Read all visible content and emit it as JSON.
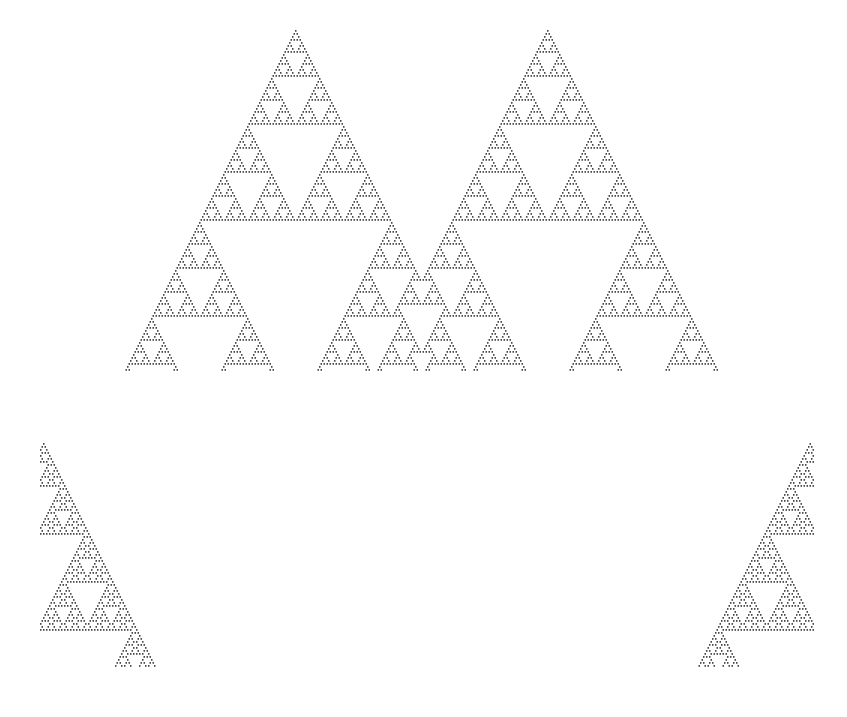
{
  "page": {
    "width": 847,
    "height": 717,
    "background": "#ffffff",
    "cell_color": "#4a4a4a"
  },
  "chart_data": {
    "type": "heatmap",
    "subtitle": "Elementary cellular automaton, rule 90, two evolving seeded blocks",
    "xlabel": "",
    "ylabel": "",
    "rule": 90,
    "rule_binary": "01011010",
    "rule_table": {
      "111": 0,
      "110": 1,
      "101": 0,
      "100": 1,
      "011": 1,
      "010": 0,
      "001": 1,
      "000": 0
    },
    "grid": false,
    "legend_position": "none",
    "cell_width_px": 1.5,
    "cell_height_px": 3,
    "on_color": "#4a4a4a",
    "off_color": "#ffffff",
    "blocks": [
      {
        "name": "upper-block",
        "origin_x": 40,
        "origin_y": 30,
        "columns": 516,
        "rows": 114,
        "seed_columns": [
          170,
          338
        ],
        "notes": "Two seed cells produce two Sierpinski gaskets that interfere mid-pattern"
      },
      {
        "name": "lower-block",
        "origin_x": 40,
        "origin_y": 443,
        "columns": 516,
        "rows": 75,
        "seed_columns": [
          2,
          513
        ],
        "notes": "Two edge seeds expand inward and collide near center bottom"
      }
    ],
    "axis_ranges": {
      "x": [
        0,
        847
      ],
      "y": [
        0,
        717
      ]
    }
  }
}
